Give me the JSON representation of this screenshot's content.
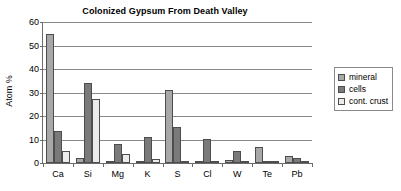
{
  "chart_data": {
    "type": "bar",
    "title": "Colonized Gypsum From Death Valley",
    "xlabel": "",
    "ylabel": "Atom %",
    "ylim": [
      0,
      60
    ],
    "ytick_step": 10,
    "ytick_labels": [
      "0",
      "10",
      "20",
      "30",
      "40",
      "50",
      "60"
    ],
    "grid": true,
    "legend_position": "right",
    "categories": [
      "Ca",
      "Si",
      "Mg",
      "K",
      "S",
      "Cl",
      "W",
      "Te",
      "Pb"
    ],
    "series": [
      {
        "name": "mineral",
        "color": "#a8a8a8",
        "values": [
          55,
          2.2,
          0.6,
          1.0,
          31.2,
          0.4,
          1.3,
          6.9,
          3.1
        ]
      },
      {
        "name": "cells",
        "color": "#7a7a7a",
        "values": [
          13.5,
          34,
          8.0,
          11.0,
          15.2,
          10.1,
          5.2,
          1.0,
          2.3
        ]
      },
      {
        "name": "cont. crust",
        "color": "#ebebeb",
        "values": [
          5.3,
          27.1,
          3.7,
          1.6,
          0.5,
          0.1,
          0.05,
          0.05,
          0.05
        ]
      }
    ]
  },
  "legend": {
    "items": [
      {
        "label": "mineral"
      },
      {
        "label": "cells"
      },
      {
        "label": "cont. crust"
      }
    ]
  },
  "colors": {
    "mineral": "#a8a8a8",
    "cells": "#7a7a7a",
    "cont_crust": "#ebebeb",
    "axis": "#6b6b6b",
    "grid": "#8a8a8a",
    "text": "#000000"
  }
}
